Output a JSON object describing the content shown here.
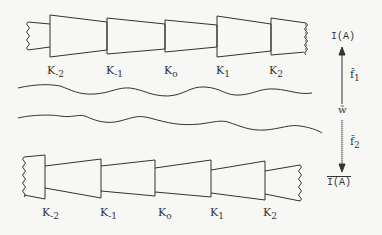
{
  "diagram": {
    "top_row": {
      "labels": [
        {
          "base": "K",
          "sub": "-2"
        },
        {
          "base": "K",
          "sub": "-1"
        },
        {
          "base": "K",
          "sub": "o"
        },
        {
          "base": "K",
          "sub": "1"
        },
        {
          "base": "K",
          "sub": "2"
        }
      ]
    },
    "bottom_row": {
      "labels": [
        {
          "base": "K",
          "sub": "-2"
        },
        {
          "base": "K",
          "sub": "-1"
        },
        {
          "base": "K",
          "sub": "o"
        },
        {
          "base": "K",
          "sub": "1"
        },
        {
          "base": "K",
          "sub": "2"
        }
      ]
    },
    "right_axis": {
      "top_label": "I(A)",
      "f1_base": "f̃",
      "f1_sub": "1",
      "w_label": "w̃",
      "f2_base": "f̃",
      "f2_sub": "2",
      "bottom_label": "I(A)"
    },
    "colors": {
      "ink": "#333333",
      "paper": "#f7f7f5"
    }
  }
}
